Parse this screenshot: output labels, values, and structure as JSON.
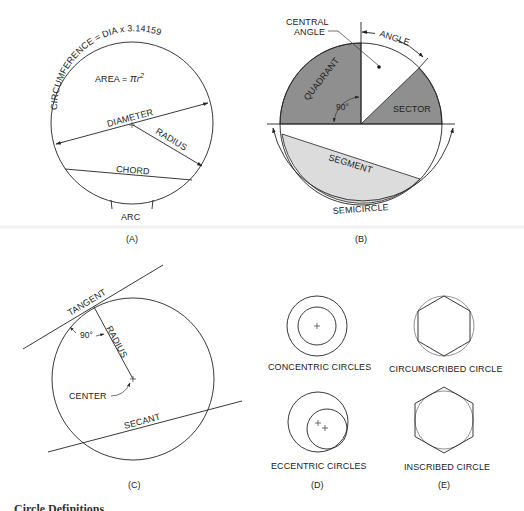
{
  "figure": {
    "type": "circle-terminology-diagram",
    "colors": {
      "line": "#222222",
      "quadrant_fill": "#8f8f8f",
      "sector_fill": "#8f8f8f",
      "segment_fill": "#dcdcdc",
      "background": "#ffffff"
    },
    "panels": {
      "a": {
        "caption": "(A)",
        "circumference_label": "CIRCUMFERENCE = DIA x 3.14159",
        "area_label_prefix": "AREA = ",
        "area_label_pi": "π",
        "area_label_r": "r",
        "area_label_exp": "2",
        "diameter_label": "DIAMETER",
        "radius_label": "RADIUS",
        "chord_label": "CHORD",
        "arc_label": "ARC"
      },
      "b": {
        "caption": "(B)",
        "central_angle_label_line1": "CENTRAL",
        "central_angle_label_line2": "ANGLE",
        "angle_label": "ANGLE",
        "quadrant_label": "QUADRANT",
        "right_angle_label": "90°",
        "sector_label": "SECTOR",
        "segment_label": "SEGMENT",
        "semicircle_label": "SEMICIRCLE"
      },
      "c": {
        "caption": "(C)",
        "tangent_label": "TANGENT",
        "radius_label": "RADIUS",
        "right_angle_label": "90°",
        "center_label": "CENTER",
        "secant_label": "SECANT"
      },
      "d": {
        "caption": "(D)",
        "concentric_label": "CONCENTRIC CIRCLES",
        "eccentric_label": "ECCENTRIC CIRCLES"
      },
      "e": {
        "caption": "(E)",
        "circumscribed_label": "CIRCUMSCRIBED CIRCLE",
        "inscribed_label": "INSCRIBED CIRCLE"
      }
    },
    "footer_caption": "Circle Definitions"
  }
}
